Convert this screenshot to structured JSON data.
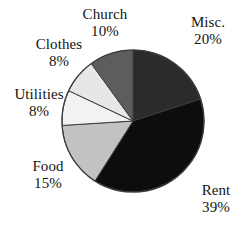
{
  "figure": {
    "kind": "pie-chart",
    "background": "#ffffff"
  },
  "chart_data": {
    "type": "pie",
    "title": "",
    "subtitle": "",
    "xlabel": "",
    "ylabel": "",
    "grid": false,
    "legend_position": "labels-outside-slices",
    "total_percent": 100,
    "start_angle_deg": 0,
    "direction": "clockwise",
    "categories": [
      "Misc.",
      "Rent",
      "Food",
      "Utilities",
      "Clothes",
      "Church"
    ],
    "values": [
      20,
      39,
      15,
      8,
      8,
      10
    ],
    "labels": [
      {
        "name": "Misc.",
        "percent_text": "20%",
        "value": 20,
        "color": "#2b2b2b"
      },
      {
        "name": "Rent",
        "percent_text": "39%",
        "value": 39,
        "color": "#0d0d0d"
      },
      {
        "name": "Food",
        "percent_text": "15%",
        "value": 15,
        "color": "#c2c2c2"
      },
      {
        "name": "Utilities",
        "percent_text": "8%",
        "value": 8,
        "color": "#f2f2f2"
      },
      {
        "name": "Clothes",
        "percent_text": "8%",
        "value": 8,
        "color": "#e7e7e7"
      },
      {
        "name": "Church",
        "percent_text": "10%",
        "value": 10,
        "color": "#5d5d5d"
      }
    ],
    "slice_outline_color": "#3d3d3d",
    "pie_center": {
      "x": 133,
      "y": 121
    },
    "pie_radius": 71
  }
}
